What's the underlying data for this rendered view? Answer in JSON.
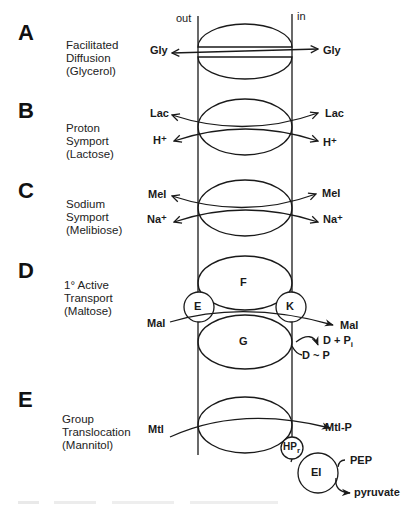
{
  "orientation": {
    "out_label": "out",
    "in_label": "in"
  },
  "panels": [
    {
      "letter": "A",
      "desc": [
        "Facilitated",
        "Diffusion",
        "(Glycerol)"
      ],
      "labels": {
        "left": "Gly",
        "right": "Gly"
      }
    },
    {
      "letter": "B",
      "desc": [
        "Proton",
        "Symport",
        "(Lactose)"
      ],
      "labels": {
        "left_top": "Lac",
        "left_bottom": "H⁺",
        "right_top": "Lac",
        "right_bottom": "H⁺"
      }
    },
    {
      "letter": "C",
      "desc": [
        "Sodium",
        "Symport",
        "(Melibiose)"
      ],
      "labels": {
        "left_top": "Mel",
        "left_bottom": "Na⁺",
        "right_top": "Mel",
        "right_bottom": "Na⁺"
      }
    },
    {
      "letter": "D",
      "desc": [
        "1° Active",
        "Transport",
        "(Maltose)"
      ],
      "labels": {
        "subunit_top": "F",
        "subunit_bottom": "G",
        "subunit_left": "E",
        "subunit_right": "K",
        "substrate_in": "Mal",
        "substrate_out": "Mal",
        "product": "D + P",
        "product_sub": "i",
        "energy": "D ~ P"
      }
    },
    {
      "letter": "E",
      "desc": [
        "Group",
        "Translocation",
        "(Mannitol)"
      ],
      "labels": {
        "substrate_in": "Mtl",
        "substrate_out": "Mtl-P",
        "hpr": "HP",
        "hpr_sub": "r",
        "enzyme": "EI",
        "donor": "PEP",
        "product": "pyruvate"
      }
    }
  ],
  "colors": {
    "stroke": "#1a1a1a",
    "background": "#ffffff"
  }
}
